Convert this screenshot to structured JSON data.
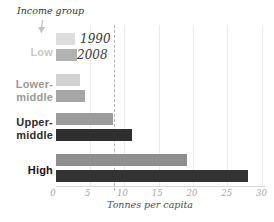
{
  "chart_data": {
    "type": "bar",
    "orientation": "horizontal",
    "title": "Income group",
    "xlabel": "Tonnes per capita",
    "xlim": [
      0,
      30
    ],
    "xticks": [
      0,
      5,
      10,
      15,
      20,
      25,
      30
    ],
    "grid": true,
    "reference_line": {
      "value": 8.4,
      "style": "dashed"
    },
    "categories": [
      "Low",
      "Lower-middle",
      "Upper-middle",
      "High"
    ],
    "series": [
      {
        "name": "1990",
        "values": [
          2.8,
          3.5,
          8.3,
          19
        ]
      },
      {
        "name": "2008",
        "values": [
          3.1,
          4.2,
          11,
          28
        ]
      }
    ],
    "groups": [
      {
        "label_lines": [
          "Low"
        ],
        "label_color": "#c7c7c7",
        "bar_colors": [
          "#dddddd",
          "#b2b2b2"
        ]
      },
      {
        "label_lines": [
          "Lower-",
          "middle"
        ],
        "label_color": "#999999",
        "bar_colors": [
          "#d1d1d1",
          "#a5a5a5"
        ]
      },
      {
        "label_lines": [
          "Upper-",
          "middle"
        ],
        "label_color": "#2d2d2d",
        "bar_colors": [
          "#9c9c9c",
          "#2f2f2f"
        ]
      },
      {
        "label_lines": [
          "High"
        ],
        "label_color": "#151515",
        "bar_colors": [
          "#8e8e8e",
          "#333333"
        ]
      }
    ],
    "colors": {
      "grid": "#ebebeb",
      "axis": "#d9d9d9",
      "tick_label": "#a5a5a5",
      "reference_line": "#b0b0b0",
      "annotation": "#3a3a3a",
      "arrow": "#c3c3c3"
    },
    "legend_position": "inline-next-to-low-bars"
  }
}
